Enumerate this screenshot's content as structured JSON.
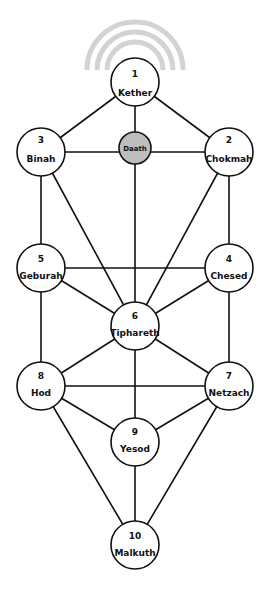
{
  "diagram": {
    "colors": {
      "line": "#111111",
      "node_fill": "#ffffff",
      "daath_fill": "#bdbdbd",
      "arc": "#d3d3d3"
    },
    "nodes": [
      {
        "id": "kether",
        "number": "1",
        "name": "Kether"
      },
      {
        "id": "chokmah",
        "number": "2",
        "name": "Chokmah"
      },
      {
        "id": "binah",
        "number": "3",
        "name": "Binah"
      },
      {
        "id": "chesed",
        "number": "4",
        "name": "Chesed"
      },
      {
        "id": "geburah",
        "number": "5",
        "name": "Geburah"
      },
      {
        "id": "tiphareth",
        "number": "6",
        "name": "Tiphareth"
      },
      {
        "id": "netzach",
        "number": "7",
        "name": "Netzach"
      },
      {
        "id": "hod",
        "number": "8",
        "name": "Hod"
      },
      {
        "id": "yesod",
        "number": "9",
        "name": "Yesod"
      },
      {
        "id": "malkuth",
        "number": "10",
        "name": "Malkuth"
      },
      {
        "id": "daath",
        "number": "",
        "name": "Daath"
      }
    ]
  }
}
